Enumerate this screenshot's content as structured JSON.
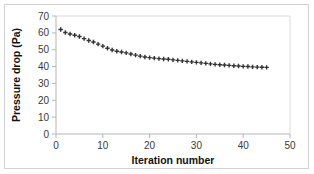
{
  "chart_data": {
    "type": "scatter",
    "title": "",
    "xlabel": "Iteration number",
    "ylabel": "Pressure drop (Pa)",
    "xlim": [
      0,
      50
    ],
    "ylim": [
      0,
      70
    ],
    "xticks": [
      0,
      10,
      20,
      30,
      40,
      50
    ],
    "yticks": [
      0,
      10,
      20,
      30,
      40,
      50,
      60,
      70
    ],
    "grid": false,
    "legend": null,
    "marker": "plus",
    "marker_color": "#333333",
    "series": [
      {
        "name": "Pressure drop",
        "x": [
          1,
          2,
          3,
          4,
          5,
          6,
          7,
          8,
          9,
          10,
          11,
          12,
          13,
          14,
          15,
          16,
          17,
          18,
          19,
          20,
          21,
          22,
          23,
          24,
          25,
          26,
          27,
          28,
          29,
          30,
          31,
          32,
          33,
          34,
          35,
          36,
          37,
          38,
          39,
          40,
          41,
          42,
          43,
          44,
          45
        ],
        "y": [
          62.0,
          60.2,
          59.3,
          58.6,
          57.8,
          56.6,
          55.5,
          54.6,
          53.3,
          52.1,
          50.9,
          49.8,
          49.1,
          48.6,
          48.1,
          47.5,
          46.8,
          46.2,
          45.7,
          45.3,
          45.0,
          44.7,
          44.5,
          44.3,
          44.0,
          43.7,
          43.4,
          43.1,
          42.8,
          42.5,
          42.2,
          41.9,
          41.6,
          41.3,
          41.1,
          40.9,
          40.7,
          40.5,
          40.3,
          40.1,
          40.0,
          39.8,
          39.7,
          39.6,
          39.5
        ]
      }
    ]
  },
  "axes": {
    "y_title": "Pressure drop (Pa)",
    "x_title": "Iteration number",
    "y_tick_labels": [
      "0",
      "10",
      "20",
      "30",
      "40",
      "50",
      "60",
      "70"
    ],
    "x_tick_labels": [
      "0",
      "10",
      "20",
      "30",
      "40",
      "50"
    ]
  },
  "colors": {
    "marker": "#333333",
    "axis": "#b0b0b0",
    "frame": "#d2d2d2",
    "tick_text": "#3a3a3a",
    "title_text": "#111111",
    "background": "#ffffff"
  }
}
